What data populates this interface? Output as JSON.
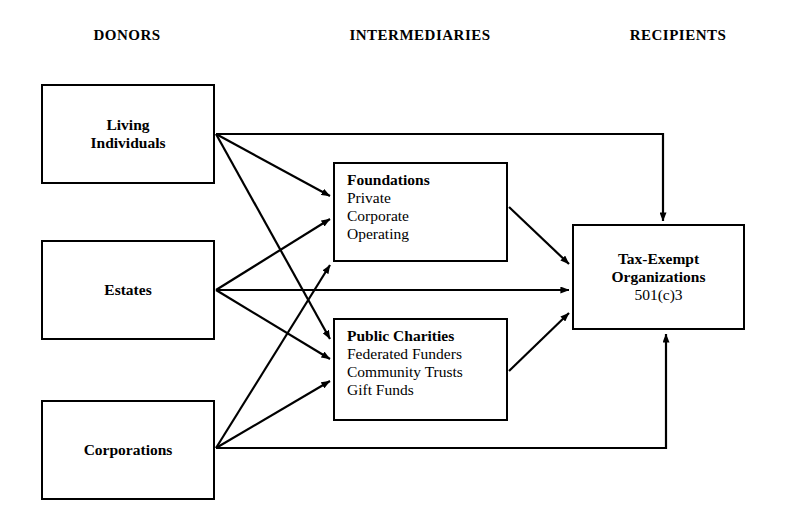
{
  "diagram": {
    "columns": [
      {
        "key": "donors",
        "label": "DONORS"
      },
      {
        "key": "intermediaries",
        "label": "INTERMEDIARIES"
      },
      {
        "key": "recipients",
        "label": "RECIPIENTS"
      }
    ],
    "nodes": {
      "living_individuals": {
        "title": "Living",
        "title_line2": "Individuals"
      },
      "estates": {
        "title": "Estates"
      },
      "corporations": {
        "title": "Corporations"
      },
      "foundations": {
        "title": "Foundations",
        "items": [
          "Private",
          "Corporate",
          "Operating"
        ]
      },
      "public_charities": {
        "title": "Public Charities",
        "items": [
          "Federated Funders",
          "Community Trusts",
          "Gift Funds"
        ]
      },
      "tax_exempt": {
        "title": "Tax-Exempt",
        "title_line2": "Organizations",
        "subtitle": "501(c)3"
      }
    },
    "edges": [
      {
        "from": "living_individuals",
        "to": "foundations"
      },
      {
        "from": "living_individuals",
        "to": "public_charities"
      },
      {
        "from": "living_individuals",
        "to": "tax_exempt"
      },
      {
        "from": "estates",
        "to": "foundations"
      },
      {
        "from": "estates",
        "to": "public_charities"
      },
      {
        "from": "estates",
        "to": "tax_exempt"
      },
      {
        "from": "corporations",
        "to": "foundations"
      },
      {
        "from": "corporations",
        "to": "public_charities"
      },
      {
        "from": "corporations",
        "to": "tax_exempt"
      },
      {
        "from": "foundations",
        "to": "tax_exempt"
      },
      {
        "from": "public_charities",
        "to": "tax_exempt"
      }
    ],
    "style": {
      "line_color": "#000000",
      "box_border_color": "#000000",
      "background": "#ffffff"
    }
  }
}
